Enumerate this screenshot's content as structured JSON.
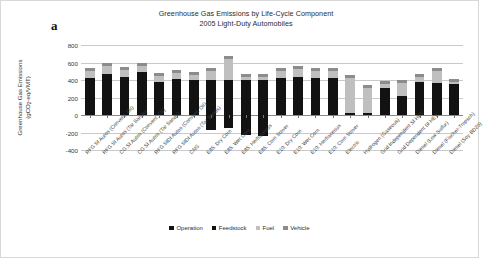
{
  "panel_letter": "a",
  "chart_data": {
    "type": "bar",
    "stacked": true,
    "title": "Greenhouse Gas Emissions by Life-Cycle Component",
    "subtitle": "2005 Light-Duty Automobiles",
    "xlabel": "",
    "ylabel_line1": "Greenhouse Gas Emissions",
    "ylabel_line2_pre": "(gCO",
    "ylabel_line2_sub": "2",
    "ylabel_line2_post": "-eq/VMT)",
    "ylim": [
      -400,
      800
    ],
    "yticks": [
      800,
      600,
      400,
      200,
      0,
      -200,
      -400
    ],
    "grid": true,
    "legend_position": "bottom",
    "legend": [
      "Operation",
      "Feedstock",
      "Fuel",
      "Vehicle"
    ],
    "colors": {
      "Operation": "#121212",
      "Feedstock": "#121212",
      "Fuel": "#bfbfbf",
      "Vehicle": "#8c8c8c"
    },
    "categories": [
      "RFG SI Autos (Convent. Oil)",
      "RFG SI Autos (Tar Sands)",
      "CG SI Autos (Convent. Oil)",
      "CG SI Autos (Tar Sands)",
      "RFG SIDI Autos (Convent. Oil)",
      "RFG SIDI Autos (Tar Sands)",
      "CNG",
      "E85: Dry Corn",
      "E85: Wet Corn",
      "E85: Herbaceous",
      "E85: Corn Stover",
      "E10: Dry Corn",
      "E10: Wet Corn",
      "E10: Herbaceous",
      "E10: Corn Stover",
      "Electric",
      "Hydrogen (Gaseous)",
      "Grid Independent SI HEV",
      "Grid Dependent SI HEV",
      "Diesel (Low Sulfur)",
      "Diesel (Fischer-Tropsch)",
      "Diesel (Soy BD20)"
    ],
    "series": [
      {
        "name": "Operation",
        "values": [
          420,
          465,
          440,
          488,
          372,
          408,
          402,
          400,
          400,
          400,
          400,
          425,
          432,
          420,
          422,
          18,
          25,
          303,
          215,
          372,
          370,
          350
        ]
      },
      {
        "name": "Feedstock",
        "values": [
          0,
          0,
          0,
          0,
          0,
          0,
          0,
          -170,
          -148,
          -225,
          -240,
          0,
          0,
          0,
          0,
          0,
          0,
          0,
          0,
          0,
          0,
          0
        ]
      },
      {
        "name": "Fuel",
        "values": [
          80,
          90,
          75,
          75,
          70,
          75,
          50,
          100,
          245,
          35,
          35,
          78,
          93,
          80,
          78,
          405,
          285,
          52,
          148,
          62,
          128,
          25
        ]
      },
      {
        "name": "Vehicle",
        "values": [
          35,
          35,
          35,
          35,
          35,
          35,
          35,
          35,
          35,
          35,
          35,
          35,
          35,
          35,
          35,
          30,
          30,
          38,
          38,
          35,
          35,
          35
        ]
      }
    ]
  }
}
